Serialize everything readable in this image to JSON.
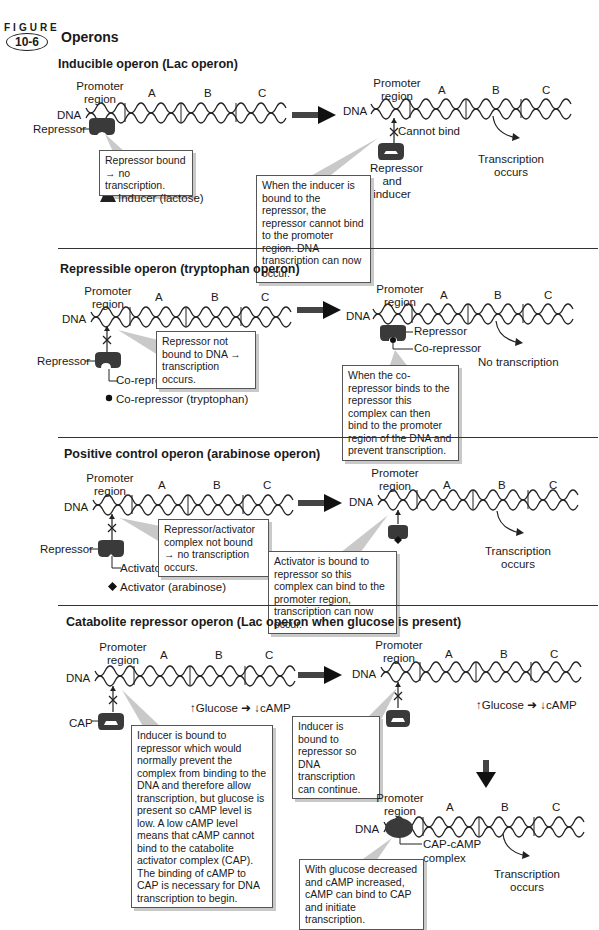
{
  "figure": {
    "label": "FIGURE",
    "number": "10-6",
    "title": "Operons"
  },
  "common": {
    "dna": "DNA",
    "promoter_line1": "Promoter",
    "promoter_line2": "region",
    "gene_a": "A",
    "gene_b": "B",
    "gene_c": "C"
  },
  "sections": [
    {
      "title": "Inducible operon (Lac operon)",
      "left": {
        "protein_label": "Repressor",
        "callout": "Repressor bound → no transcription.",
        "legend": "Inducer (lactose)"
      },
      "right": {
        "block_label": "Cannot bind",
        "protein_label_lines": [
          "Repressor",
          "and",
          "inducer"
        ],
        "outcome_lines": [
          "Transcription",
          "occurs"
        ],
        "callout": "When the inducer is bound to the repressor, the repressor cannot bind to the promoter region. DNA transcription can now occur."
      }
    },
    {
      "title": "Repressible operon (tryptophan operon)",
      "left": {
        "protein_label": "Repressor",
        "site_label": "Co-repressor site",
        "callout": "Repressor not bound to DNA → transcription occurs.",
        "legend": "Co-repressor (tryptophan)"
      },
      "right": {
        "protein_label": "Repressor",
        "corepressor_label": "Co-repressor",
        "outcome": "No transcription",
        "callout": "When the co-repressor binds to the repressor this complex can then bind to the promoter region of the DNA and prevent transcription."
      }
    },
    {
      "title": "Positive control operon (arabinose operon)",
      "left": {
        "protein_label": "Repressor",
        "site_label": "Activator site",
        "callout": "Repressor/activator complex not bound → no transcription occurs.",
        "legend": "Activator (arabinose)"
      },
      "right": {
        "outcome_lines": [
          "Transcription",
          "occurs"
        ],
        "callout": "Activator is bound to repressor so this complex can bind to the promoter region, transcription can now occur."
      }
    },
    {
      "title": "Catabolite repressor operon (Lac operon when glucose is present)",
      "left": {
        "protein_label": "CAP",
        "glucose_note": "↑Glucose ➜ ↓cAMP",
        "callout": "Inducer is bound to repressor which would normally prevent the complex from binding to the DNA and therefore allow transcription, but glucose is present so cAMP level is low. A low cAMP level means that cAMP cannot bind to the catabolite activator complex (CAP). The binding of cAMP to CAP is necessary for DNA transcription to begin."
      },
      "right": {
        "glucose_note": "↑Glucose ➜ ↓cAMP",
        "callout": "Inducer is bound to repressor so DNA transcription can continue."
      },
      "bottom": {
        "complex_label_lines": [
          "CAP-cAMP",
          "complex"
        ],
        "outcome_lines": [
          "Transcription",
          "occurs"
        ],
        "callout": "With glucose decreased and cAMP increased, cAMP can bind to CAP and initiate transcription."
      }
    }
  ],
  "colors": {
    "ink": "#1a1a1a",
    "protein": "#3a3a3a",
    "shadow": "#c9c9c9"
  }
}
